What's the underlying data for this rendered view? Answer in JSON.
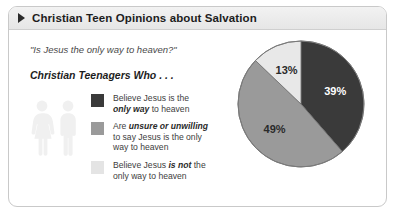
{
  "card": {
    "title": "Christian Teen Opinions about Salvation",
    "bullet_icon": "triangle-right-icon",
    "question": "\"Is Jesus the only way to heaven?\"",
    "subhead": "Christian Teenagers Who . . .",
    "people_icon": "two-people-icon"
  },
  "legend": [
    {
      "swatch_color": "#3a3a3a",
      "line1_pre": "Believe Jesus is the",
      "line2_em": "only way",
      "line2_post": " to heaven",
      "line1_em": "",
      "line1_post": "",
      "line3": ""
    },
    {
      "swatch_color": "#9a9a9a",
      "line1_pre": "Are ",
      "line1_em": "unsure or unwilling",
      "line1_post": "",
      "line2_em": "",
      "line2_post": "to say Jesus is the only",
      "line3": "way to heaven"
    },
    {
      "swatch_color": "#e4e4e4",
      "line1_pre": "Believe Jesus ",
      "line1_em": "is not",
      "line1_post": " the",
      "line2_em": "",
      "line2_post": "only way to heaven",
      "line3": ""
    }
  ],
  "chart_data": {
    "type": "pie",
    "title": "Christian Teen Opinions about Salvation",
    "subtitle": "\"Is Jesus the only way to heaven?\"",
    "categories": [
      "Believe Jesus is the only way to heaven",
      "Are unsure or unwilling to say Jesus is the only way to heaven",
      "Believe Jesus is not the only way to heaven"
    ],
    "values": [
      39,
      49,
      13
    ],
    "labels": [
      "39%",
      "49%",
      "13%"
    ],
    "colors": [
      "#3a3a3a",
      "#9a9a9a",
      "#e8e8e8"
    ],
    "label_colors": [
      "#ffffff",
      "#2a2a2a",
      "#2a2a2a"
    ],
    "units": "percent",
    "legend_position": "left",
    "grid": false,
    "start_angle_deg": 0,
    "direction": "clockwise"
  }
}
